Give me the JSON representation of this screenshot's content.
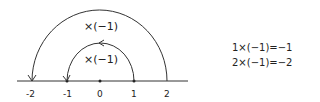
{
  "diagram": {
    "type": "number-line-rotation",
    "axis": {
      "ticks": [
        {
          "label": "-2",
          "x": 32
        },
        {
          "label": "-1",
          "x": 67
        },
        {
          "label": "0",
          "x": 100
        },
        {
          "label": "1",
          "x": 134
        },
        {
          "label": "2",
          "x": 167
        }
      ]
    },
    "arcs": [
      {
        "label": "×(−1)",
        "from": "2",
        "to": "-2"
      },
      {
        "label": "×(−1)",
        "from": "1",
        "to": "-1"
      }
    ],
    "equations": [
      "1×(−1)=−1",
      "2×(−1)=−2"
    ]
  }
}
